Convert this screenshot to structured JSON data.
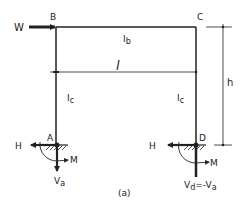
{
  "diagram": {
    "type": "portal-frame",
    "caption": "(a)",
    "nodes": {
      "B": "B",
      "C": "C",
      "A": "A",
      "D": "D"
    },
    "members": {
      "beam_inertia": "I",
      "beam_inertia_sub": "b",
      "left_column_inertia": "I",
      "left_column_inertia_sub": "c",
      "right_column_inertia": "I",
      "right_column_inertia_sub": "c"
    },
    "dimensions": {
      "span": "l",
      "height": "h"
    },
    "loads": {
      "horizontal_load": "W"
    },
    "reactions": {
      "A": {
        "horizontal": "H",
        "moment": "M",
        "vertical": "V",
        "vertical_sub": "a"
      },
      "D": {
        "horizontal": "H",
        "moment": "M",
        "vertical": "V",
        "vertical_sub": "d",
        "vertical_eq": "=-V",
        "vertical_eq_sub": "a"
      }
    },
    "colors": {
      "line": "#222222",
      "background": "#ffffff"
    }
  }
}
